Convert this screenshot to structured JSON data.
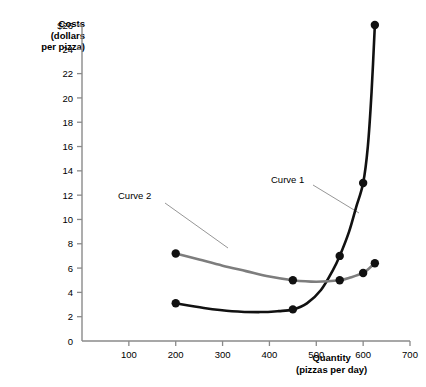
{
  "chart_data": {
    "type": "line",
    "title": "",
    "xlabel": "Quantity",
    "xlabel_sub": "(pizzas per day)",
    "ylabel": "Costs",
    "ylabel_sub1": "(dollars",
    "ylabel_sub2": "per pizza)",
    "xlim": [
      0,
      700
    ],
    "ylim": [
      0,
      26
    ],
    "xticks": [
      0,
      100,
      200,
      300,
      400,
      500,
      600,
      700
    ],
    "xtick_labels": [
      "",
      "100",
      "200",
      "300",
      "400",
      "500",
      "600",
      "700"
    ],
    "yticks": [
      0,
      2,
      4,
      6,
      8,
      10,
      12,
      14,
      16,
      18,
      20,
      22,
      24,
      26
    ],
    "ytick_labels": [
      "0",
      "2",
      "4",
      "6",
      "8",
      "10",
      "12",
      "14",
      "16",
      "18",
      "20",
      "22",
      "24",
      "$26"
    ],
    "grid": false,
    "legend_position": "annotated-inline",
    "series": [
      {
        "name": "Curve 1",
        "color": "#111111",
        "label_text": "Curve 1",
        "markers": [
          {
            "x": 200,
            "y": 3.1
          },
          {
            "x": 450,
            "y": 2.6
          },
          {
            "x": 550,
            "y": 7.0
          },
          {
            "x": 600,
            "y": 13.0
          },
          {
            "x": 625,
            "y": 26.0
          }
        ],
        "path": [
          {
            "x": 200,
            "y": 3.1
          },
          {
            "x": 260,
            "y": 2.72
          },
          {
            "x": 320,
            "y": 2.45
          },
          {
            "x": 380,
            "y": 2.38
          },
          {
            "x": 420,
            "y": 2.46
          },
          {
            "x": 450,
            "y": 2.6
          },
          {
            "x": 480,
            "y": 3.1
          },
          {
            "x": 510,
            "y": 4.2
          },
          {
            "x": 535,
            "y": 5.8
          },
          {
            "x": 550,
            "y": 7.0
          },
          {
            "x": 570,
            "y": 9.0
          },
          {
            "x": 585,
            "y": 11.0
          },
          {
            "x": 600,
            "y": 13.0
          },
          {
            "x": 610,
            "y": 16.0
          },
          {
            "x": 618,
            "y": 20.5
          },
          {
            "x": 625,
            "y": 26.0
          }
        ]
      },
      {
        "name": "Curve 2",
        "color": "#7d7d7d",
        "label_text": "Curve 2",
        "markers": [
          {
            "x": 200,
            "y": 7.2
          },
          {
            "x": 450,
            "y": 5.0
          },
          {
            "x": 550,
            "y": 5.0
          },
          {
            "x": 600,
            "y": 5.6
          },
          {
            "x": 625,
            "y": 6.4
          }
        ],
        "path": [
          {
            "x": 200,
            "y": 7.2
          },
          {
            "x": 250,
            "y": 6.7
          },
          {
            "x": 300,
            "y": 6.2
          },
          {
            "x": 350,
            "y": 5.75
          },
          {
            "x": 400,
            "y": 5.3
          },
          {
            "x": 450,
            "y": 5.0
          },
          {
            "x": 500,
            "y": 4.88
          },
          {
            "x": 550,
            "y": 5.0
          },
          {
            "x": 575,
            "y": 5.25
          },
          {
            "x": 600,
            "y": 5.6
          },
          {
            "x": 612,
            "y": 5.95
          },
          {
            "x": 625,
            "y": 6.4
          }
        ]
      }
    ],
    "annotations": [
      {
        "name": "curve-2-callout",
        "text": "Curve 2",
        "leader_from": {
          "x": 165,
          "y": 203
        },
        "leader_to": {
          "x": 228,
          "y": 248
        }
      },
      {
        "name": "curve-1-callout",
        "text": "Curve 1",
        "leader_from": {
          "x": 313,
          "y": 185
        },
        "leader_to": {
          "x": 359,
          "y": 213
        }
      }
    ],
    "axis_color": "#8a8a8a",
    "marker_color": "#111111",
    "background": "#ffffff"
  }
}
